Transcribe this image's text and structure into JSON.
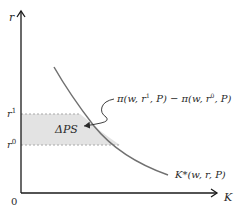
{
  "diagram": {
    "y_axis_label": "r",
    "x_axis_label": "K",
    "origin_label": "0",
    "r1_label": "r",
    "r1_sup": "1",
    "r0_label": "r",
    "r0_sup": "0",
    "area_label": "ΔPS",
    "curve_label": "K*(w, r, P)",
    "annotation": {
      "pi": "π",
      "part1": "(w, r",
      "sup1": "1",
      "part2": ", P) − π(w, r",
      "sup2": "0",
      "part3": ", P)"
    },
    "colors": {
      "axis": "#1a1a1a",
      "curve": "#707070",
      "shade": "#e3e3e3",
      "dashed": "#a8a8a8",
      "text": "#2a2a2a"
    }
  }
}
